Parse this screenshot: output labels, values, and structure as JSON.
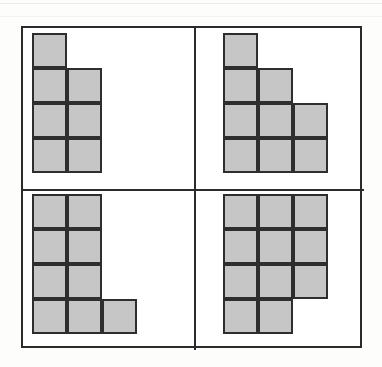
{
  "figure": {
    "cell_size_px": 35,
    "fill_color": "#c6c6c6",
    "stroke_color": "#2e2e2e",
    "frame_color": "#2b2b2b",
    "background_color": "#ffffff"
  },
  "quadrants": [
    {
      "id": "top-left",
      "name": "shape-top-left",
      "cell_count": 7,
      "row_counts": [
        1,
        2,
        2,
        2
      ],
      "origin": {
        "x": 9,
        "y": 5
      },
      "cells": [
        {
          "col": 0,
          "row": 0
        },
        {
          "col": 0,
          "row": 1
        },
        {
          "col": 1,
          "row": 1
        },
        {
          "col": 0,
          "row": 2
        },
        {
          "col": 1,
          "row": 2
        },
        {
          "col": 0,
          "row": 3
        },
        {
          "col": 1,
          "row": 3
        }
      ]
    },
    {
      "id": "top-right",
      "name": "shape-top-right",
      "cell_count": 9,
      "row_counts": [
        1,
        2,
        3,
        3
      ],
      "origin": {
        "x": 27,
        "y": 5
      },
      "cells": [
        {
          "col": 0,
          "row": 0
        },
        {
          "col": 0,
          "row": 1
        },
        {
          "col": 1,
          "row": 1
        },
        {
          "col": 0,
          "row": 2
        },
        {
          "col": 1,
          "row": 2
        },
        {
          "col": 2,
          "row": 2
        },
        {
          "col": 0,
          "row": 3
        },
        {
          "col": 1,
          "row": 3
        },
        {
          "col": 2,
          "row": 3
        }
      ]
    },
    {
      "id": "bottom-left",
      "name": "shape-bottom-left",
      "cell_count": 9,
      "row_counts": [
        2,
        2,
        2,
        3
      ],
      "origin": {
        "x": 9,
        "y": 3
      },
      "cells": [
        {
          "col": 0,
          "row": 0
        },
        {
          "col": 1,
          "row": 0
        },
        {
          "col": 0,
          "row": 1
        },
        {
          "col": 1,
          "row": 1
        },
        {
          "col": 0,
          "row": 2
        },
        {
          "col": 1,
          "row": 2
        },
        {
          "col": 0,
          "row": 3
        },
        {
          "col": 1,
          "row": 3
        },
        {
          "col": 2,
          "row": 3
        }
      ]
    },
    {
      "id": "bottom-right",
      "name": "shape-bottom-right",
      "cell_count": 11,
      "row_counts": [
        3,
        3,
        3,
        2
      ],
      "origin": {
        "x": 27,
        "y": 3
      },
      "cells": [
        {
          "col": 0,
          "row": 0
        },
        {
          "col": 1,
          "row": 0
        },
        {
          "col": 2,
          "row": 0
        },
        {
          "col": 0,
          "row": 1
        },
        {
          "col": 1,
          "row": 1
        },
        {
          "col": 2,
          "row": 1
        },
        {
          "col": 0,
          "row": 2
        },
        {
          "col": 1,
          "row": 2
        },
        {
          "col": 2,
          "row": 2
        },
        {
          "col": 0,
          "row": 3
        },
        {
          "col": 1,
          "row": 3
        }
      ]
    }
  ]
}
